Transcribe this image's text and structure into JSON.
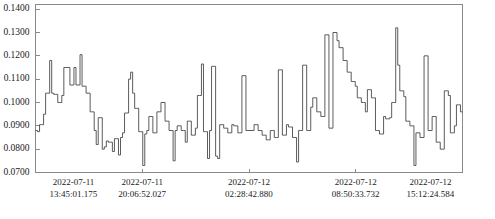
{
  "chart_data": {
    "type": "line",
    "title": "",
    "subtitle": "",
    "xlabel": "",
    "ylabel": "",
    "style": "step",
    "grid": false,
    "legend": null,
    "line_color": "#4a4a4a",
    "frame_color": "#8a8a8a",
    "background": "#ffffff",
    "ylim": [
      0.07,
      0.142
    ],
    "ytick_values": [
      0.07,
      0.08,
      0.09,
      0.1,
      0.11,
      0.12,
      0.13,
      0.14
    ],
    "ytick_labels": [
      "0.0700",
      "0.0800",
      "0.0900",
      "0.1000",
      "0.1100",
      "0.1200",
      "0.1300",
      "0.1400"
    ],
    "xtick_labels": [
      {
        "date": "2022-07-11",
        "time": "13:45:01.175"
      },
      {
        "date": "2022-07-11",
        "time": "20:06:52.027"
      },
      {
        "date": "2022-07-12",
        "time": "02:28:42.880"
      },
      {
        "date": "2022-07-12",
        "time": "08:50:33.732"
      },
      {
        "date": "2022-07-12",
        "time": "15:12:24.584"
      }
    ],
    "xtick_positions": [
      0,
      0.25,
      0.5,
      0.75,
      1.0
    ],
    "x_start": "2022-07-11 13:45:01.175",
    "x_end": "2022-07-12 15:12:24.584",
    "n_points": 190,
    "values": [
      0.088,
      0.0875,
      0.0905,
      0.0905,
      0.095,
      0.104,
      0.104,
      0.118,
      0.104,
      0.1035,
      0.1035,
      0.1,
      0.1,
      0.103,
      0.115,
      0.115,
      0.115,
      0.1075,
      0.1075,
      0.115,
      0.1075,
      0.1075,
      0.1205,
      0.107,
      0.107,
      0.104,
      0.104,
      0.096,
      0.096,
      0.088,
      0.082,
      0.0935,
      0.0935,
      0.08,
      0.081,
      0.0835,
      0.083,
      0.083,
      0.079,
      0.0845,
      0.0845,
      0.0775,
      0.085,
      0.087,
      0.0955,
      0.0955,
      0.11,
      0.113,
      0.104,
      0.0975,
      0.0975,
      0.0875,
      0.0875,
      0.073,
      0.0865,
      0.088,
      0.094,
      0.094,
      0.087,
      0.087,
      0.096,
      0.096,
      0.1,
      0.1,
      0.092,
      0.092,
      0.088,
      0.088,
      0.075,
      0.088,
      0.09,
      0.09,
      0.088,
      0.088,
      0.083,
      0.092,
      0.092,
      0.086,
      0.086,
      0.089,
      0.103,
      0.103,
      0.1165,
      0.0875,
      0.0875,
      0.076,
      0.088,
      0.1155,
      0.1155,
      0.077,
      0.076,
      0.0905,
      0.0905,
      0.089,
      0.089,
      0.087,
      0.087,
      0.0905,
      0.09,
      0.09,
      0.087,
      0.087,
      0.1115,
      0.1115,
      0.088,
      0.088,
      0.088,
      0.088,
      0.0905,
      0.0905,
      0.088,
      0.088,
      0.086,
      0.086,
      0.084,
      0.084,
      0.088,
      0.088,
      0.085,
      0.085,
      0.114,
      0.114,
      0.086,
      0.086,
      0.0905,
      0.0895,
      0.0895,
      0.085,
      0.085,
      0.0745,
      0.088,
      0.088,
      0.116,
      0.116,
      0.088,
      0.088,
      0.098,
      0.102,
      0.102,
      0.096,
      0.096,
      0.094,
      0.094,
      0.129,
      0.129,
      0.089,
      0.089,
      0.13,
      0.13,
      0.1265,
      0.1235,
      0.1235,
      0.118,
      0.118,
      0.113,
      0.113,
      0.109,
      0.109,
      0.107,
      0.102,
      0.102,
      0.1,
      0.1,
      0.096,
      0.1055,
      0.1055,
      0.102,
      0.102,
      0.088,
      0.088,
      0.0865,
      0.0865,
      0.094,
      0.093,
      0.093,
      0.0935,
      0.1,
      0.1,
      0.132,
      0.116,
      0.105,
      0.105,
      0.1025,
      0.092,
      0.092,
      0.09,
      0.09,
      0.073,
      0.087,
      0.087,
      0.085,
      0.085,
      0.12,
      0.12,
      0.088,
      0.088,
      0.094,
      0.094,
      0.083,
      0.083,
      0.08,
      0.08,
      0.105,
      0.105,
      0.103,
      0.087,
      0.087,
      0.09,
      0.099,
      0.099,
      0.096,
      0.096
    ]
  }
}
